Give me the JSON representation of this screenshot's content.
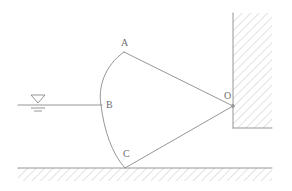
{
  "figure": {
    "type": "engineering-line-diagram",
    "canvas": {
      "width": 292,
      "height": 191
    },
    "colors": {
      "background": "#ffffff",
      "line": "#8a8a8a",
      "hatch": "#b8b8b8",
      "label": "#6e6e6e"
    },
    "stroke_width": 0.9
  },
  "labels": [
    {
      "id": "A",
      "text": "A",
      "x": 121,
      "y": 38
    },
    {
      "id": "B",
      "text": "B",
      "x": 106,
      "y": 100
    },
    {
      "id": "C",
      "text": "C",
      "x": 123,
      "y": 149
    },
    {
      "id": "O",
      "text": "O",
      "x": 224,
      "y": 91
    }
  ],
  "points": {
    "A": {
      "x": 124,
      "y": 52
    },
    "B": {
      "x": 101,
      "y": 105
    },
    "C": {
      "x": 125,
      "y": 168
    },
    "O": {
      "x": 233,
      "y": 106
    }
  },
  "geometry": {
    "arc_ABC": "M 124 52 C 104 66 98 88 101 105 C 104 130 112 154 125 168",
    "line_AO": {
      "x1": 124,
      "y1": 52,
      "x2": 233,
      "y2": 106
    },
    "line_CO": {
      "x1": 125,
      "y1": 168,
      "x2": 233,
      "y2": 106
    },
    "water_line": {
      "x1": 18,
      "y1": 105,
      "x2": 102,
      "y2": 105
    },
    "ground_line": {
      "x1": 18,
      "y1": 168,
      "x2": 272,
      "y2": 168
    },
    "wall_vertical": {
      "x1": 233,
      "y1": 13,
      "x2": 233,
      "y2": 128
    },
    "wall_ledge": {
      "x1": 233,
      "y1": 128,
      "x2": 272,
      "y2": 128
    }
  },
  "water_symbol": {
    "name": "water-surface-level-marker",
    "triangle": {
      "x1": 31,
      "y1": 95,
      "x2": 45,
      "y2": 95,
      "apex_x": 38,
      "apex_y": 103
    },
    "tick_long": {
      "x1": 31,
      "y1": 108,
      "x2": 45,
      "y2": 108
    },
    "tick_short": {
      "x1": 34,
      "y1": 111,
      "x2": 42,
      "y2": 111
    }
  },
  "hatching": {
    "ground": {
      "region": "below-ground-line",
      "angle_deg": 45,
      "spacing": 6
    },
    "wall": {
      "region": "right-of-vertical-wall",
      "angle_deg": 45,
      "spacing": 6
    }
  }
}
